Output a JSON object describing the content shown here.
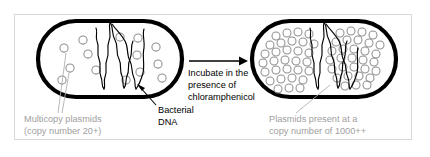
{
  "figure": {
    "frame_color": "#d8d8d8",
    "background_color": "#ffffff"
  },
  "left_cell": {
    "name": "bacterial cell before amplification",
    "outline_color": "#000000",
    "plasmid_color": "#8f8f8f",
    "plasmid_count": 14,
    "caption_line1": "Multicopy plasmids",
    "caption_line2": "(copy number 20+)",
    "caption_color": "#a0a0a0",
    "dna_label_line1": "Bacterial",
    "dna_label_line2": "DNA",
    "dna_label_color": "#000000"
  },
  "transition": {
    "arrow_direction": "right",
    "arrow_color": "#000000",
    "label_line1": "Incubate in the",
    "label_line2": "presence of",
    "label_line3": "chloramphenicol",
    "label_color": "#000000"
  },
  "right_cell": {
    "name": "bacterial cell after amplification",
    "outline_color": "#000000",
    "plasmid_color": "#8f8f8f",
    "plasmid_count": 62,
    "caption_line1": "Plasmids present at a",
    "caption_line2": "copy number of 1000++",
    "caption_color": "#a0a0a0"
  }
}
